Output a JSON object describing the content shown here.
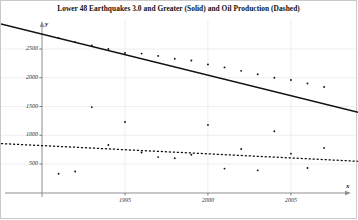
{
  "chart_data": {
    "type": "scatter",
    "title": "Lower 48 Earthquakes 3.0 and Greater (Solid) and Oil Production (Dashed)",
    "xlabel": "x",
    "ylabel": "y",
    "xlim": [
      1990.0,
      2008.5
    ],
    "ylim": [
      0,
      2900
    ],
    "grid": true,
    "legend": "none",
    "xticks": [
      1995,
      2000,
      2005
    ],
    "xtick_labels": [
      "1995",
      "2000",
      "2005"
    ],
    "yticks": [
      500,
      1000,
      1500,
      2000,
      2500
    ],
    "ytick_labels": [
      "500",
      "1000",
      "1500",
      "2000",
      "2500"
    ],
    "series": [
      {
        "name": "Lower 48 Earthquakes 3.0 and Greater",
        "style": "solid",
        "marker": "point",
        "color": "#111111",
        "x": [
          1991,
          1992,
          1993,
          1994,
          1995,
          1996,
          1997,
          1998,
          1999,
          2000,
          2001,
          2002,
          2003,
          2004,
          2005,
          2006,
          2007
        ],
        "y": [
          2690,
          2620,
          2560,
          2500,
          2430,
          2420,
          2380,
          2330,
          2300,
          2230,
          2180,
          2120,
          2060,
          2000,
          1960,
          1900,
          1840
        ],
        "fit": {
          "type": "linear",
          "x": [
            1990.0,
            2008.5
          ],
          "y": [
            2760,
            1440
          ]
        }
      },
      {
        "name": "Oil Production",
        "style": "dashed",
        "marker": "point",
        "color": "#111111",
        "x": [
          1991,
          1992,
          1993,
          1994,
          1995,
          1996,
          1997,
          1998,
          1999,
          2000,
          2001,
          2002,
          2003,
          2004,
          2005,
          2006,
          2007
        ],
        "y": [
          330,
          370,
          1490,
          830,
          1230,
          700,
          620,
          600,
          660,
          1180,
          420,
          760,
          390,
          1070,
          680,
          430,
          780
        ],
        "fit": {
          "type": "linear",
          "x": [
            1990.0,
            2008.5
          ],
          "y": [
            820,
            555
          ]
        }
      }
    ]
  }
}
